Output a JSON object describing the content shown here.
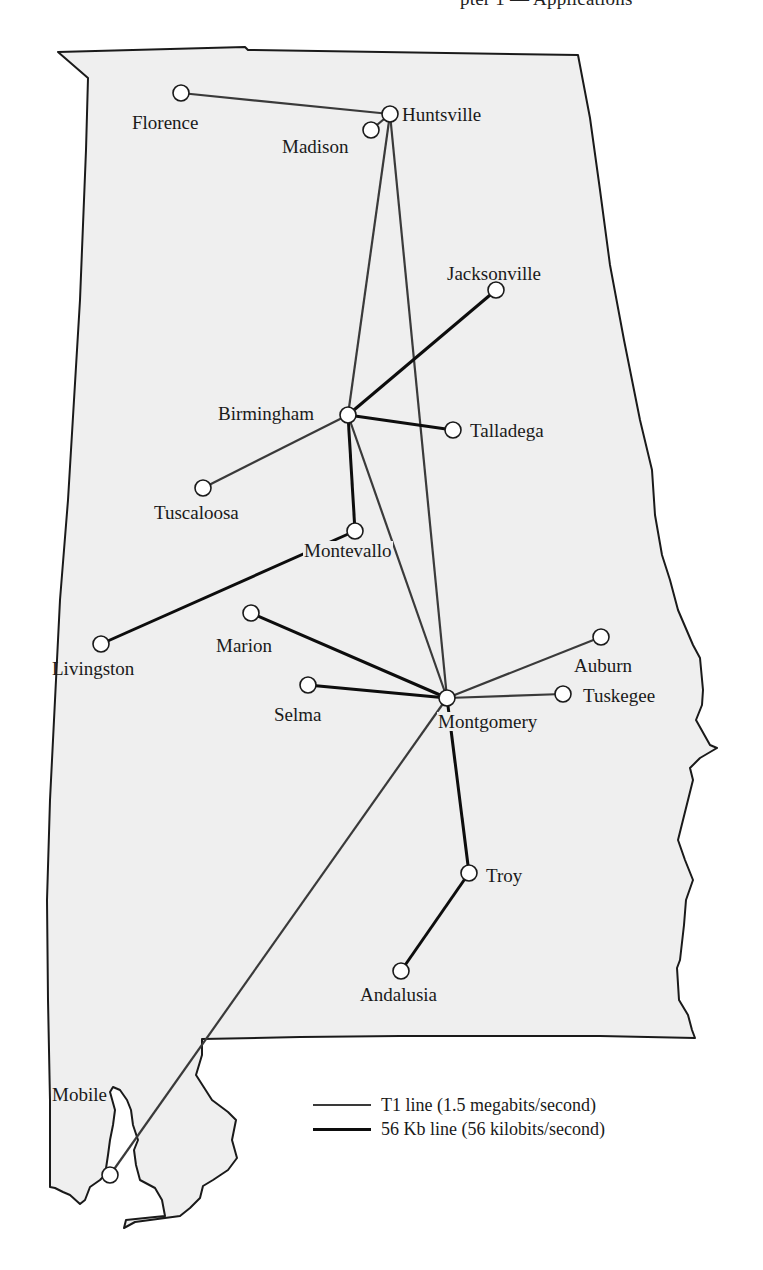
{
  "header": {
    "cut_off_text": "pter 1 — Applications"
  },
  "colors": {
    "state_fill": "#efefef",
    "state_stroke": "#1a1a1a",
    "t1_line": "#3a3a3a",
    "kb56_line": "#0d0d0d",
    "node_fill": "#ffffff"
  },
  "cities": [
    {
      "id": "florence",
      "name": "Florence",
      "x": 181,
      "y": 93
    },
    {
      "id": "huntsville",
      "name": "Huntsville",
      "x": 390,
      "y": 114
    },
    {
      "id": "madison",
      "name": "Madison",
      "x": 371,
      "y": 130
    },
    {
      "id": "jacksonville",
      "name": "Jacksonville",
      "x": 496,
      "y": 290
    },
    {
      "id": "birmingham",
      "name": "Birmingham",
      "x": 348,
      "y": 415
    },
    {
      "id": "talladega",
      "name": "Talladega",
      "x": 453,
      "y": 430
    },
    {
      "id": "tuscaloosa",
      "name": "Tuscaloosa",
      "x": 203,
      "y": 488
    },
    {
      "id": "montevallo",
      "name": "Montevallo",
      "x": 355,
      "y": 531
    },
    {
      "id": "livingston",
      "name": "Livingston",
      "x": 101,
      "y": 644
    },
    {
      "id": "marion",
      "name": "Marion",
      "x": 251,
      "y": 613
    },
    {
      "id": "selma",
      "name": "Selma",
      "x": 308,
      "y": 685
    },
    {
      "id": "montgomery",
      "name": "Montgomery",
      "x": 447,
      "y": 698
    },
    {
      "id": "auburn",
      "name": "Auburn",
      "x": 601,
      "y": 637
    },
    {
      "id": "tuskegee",
      "name": "Tuskegee",
      "x": 563,
      "y": 694
    },
    {
      "id": "troy",
      "name": "Troy",
      "x": 469,
      "y": 873
    },
    {
      "id": "andalusia",
      "name": "Andalusia",
      "x": 401,
      "y": 971
    },
    {
      "id": "mobile",
      "name": "Mobile",
      "x": 110,
      "y": 1175
    }
  ],
  "links": [
    {
      "from": "florence",
      "to": "huntsville",
      "type": "T1"
    },
    {
      "from": "madison",
      "to": "huntsville",
      "type": "T1"
    },
    {
      "from": "huntsville",
      "to": "birmingham",
      "type": "T1"
    },
    {
      "from": "huntsville",
      "to": "montgomery",
      "type": "T1"
    },
    {
      "from": "birmingham",
      "to": "tuscaloosa",
      "type": "T1"
    },
    {
      "from": "birmingham",
      "to": "montgomery",
      "type": "T1"
    },
    {
      "from": "birmingham",
      "to": "jacksonville",
      "type": "56Kb"
    },
    {
      "from": "birmingham",
      "to": "talladega",
      "type": "56Kb"
    },
    {
      "from": "birmingham",
      "to": "montevallo",
      "type": "56Kb"
    },
    {
      "from": "montevallo",
      "to": "livingston",
      "type": "56Kb"
    },
    {
      "from": "marion",
      "to": "montgomery",
      "type": "56Kb"
    },
    {
      "from": "selma",
      "to": "montgomery",
      "type": "56Kb"
    },
    {
      "from": "montgomery",
      "to": "auburn",
      "type": "T1"
    },
    {
      "from": "montgomery",
      "to": "tuskegee",
      "type": "T1"
    },
    {
      "from": "montgomery",
      "to": "troy",
      "type": "56Kb"
    },
    {
      "from": "troy",
      "to": "andalusia",
      "type": "56Kb"
    },
    {
      "from": "montgomery",
      "to": "mobile",
      "type": "T1"
    }
  ],
  "legend": {
    "items": [
      {
        "type": "T1",
        "label": "T1 line (1.5 megabits/second)"
      },
      {
        "type": "56Kb",
        "label": "56 Kb line (56 kilobits/second)"
      }
    ]
  }
}
